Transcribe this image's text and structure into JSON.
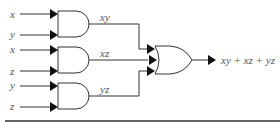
{
  "diagram": {
    "type": "logic-circuit",
    "inputs": [
      {
        "label": "x"
      },
      {
        "label": "y"
      },
      {
        "label": "x"
      },
      {
        "label": "z"
      },
      {
        "label": "y"
      },
      {
        "label": "z"
      }
    ],
    "and_gates": [
      {
        "output_label": "xy"
      },
      {
        "output_label": "xz"
      },
      {
        "output_label": "yz"
      }
    ],
    "or_gate": {
      "output_label": "xy + xz + yz"
    }
  }
}
